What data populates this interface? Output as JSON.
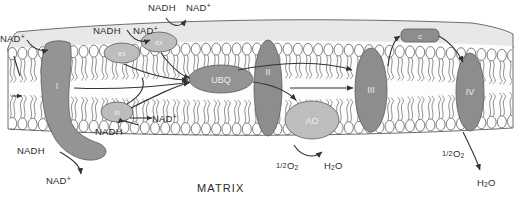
{
  "figure": {
    "title_text": "MATRIX"
  },
  "colors": {
    "complex_dark_gray": "#8a8a8a",
    "complex_mid_gray": "#9b9b9b",
    "complex_light_gray": "#bdbdbd",
    "membrane_space_fill": "#e8e8e8",
    "membrane_tail_fill": "#f7f7f7",
    "head_fill": "#ffffff",
    "outline": "#4a4a4a",
    "text": "#2b2b2b",
    "arrow": "#333333"
  },
  "complexes": [
    {
      "id": "complex-i",
      "label": "I",
      "tone": "dark"
    },
    {
      "id": "complex-ii",
      "label": "II",
      "tone": "dark"
    },
    {
      "id": "complex-iii",
      "label": "III",
      "tone": "dark"
    },
    {
      "id": "complex-iv",
      "label": "IV",
      "tone": "dark"
    },
    {
      "id": "ubiquinone",
      "label": "UBQ",
      "tone": "dark"
    },
    {
      "id": "alternative-oxidase",
      "label": "AO",
      "tone": "light"
    },
    {
      "id": "cytochrome-c",
      "label": "c",
      "tone": "dark"
    },
    {
      "id": "nadh-dehydrogenase-external",
      "label": "ex",
      "tone": "light"
    },
    {
      "id": "nadh-dehydrogenase-external-2",
      "label": "ex",
      "tone": "light"
    },
    {
      "id": "nadh-dehydrogenase-internal",
      "label": "in",
      "tone": "light"
    }
  ],
  "labels": {
    "nadh_top_outer": "NADH",
    "nad_top_outer": "NAD",
    "nadh_top_inner": "NADH",
    "nad_top_inner": "NAD",
    "nad_left_upper": "NAD",
    "nad_internal": "NAD",
    "nadh_internal": "NADH",
    "nadh_matrix": "NADH",
    "nad_matrix": "NAD",
    "plus_sign": "+",
    "oxygen_ao": "O",
    "oxygen_ao_sub": "2",
    "oxygen_ao_frac": "1/2",
    "water_ao": "H",
    "water_ao_sub": "2",
    "water_ao_tail": "O",
    "oxygen_iv": "O",
    "oxygen_iv_sub": "2",
    "oxygen_iv_frac": "1/2",
    "water_iv": "H",
    "water_iv_sub": "2",
    "water_iv_tail": "O",
    "matrix": "MATRIX"
  }
}
